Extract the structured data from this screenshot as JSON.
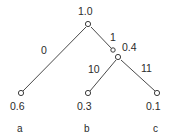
{
  "diagram": {
    "type": "binary-code-tree",
    "title": "",
    "colors": {
      "background": "#ffffff",
      "edge": "#4a4a4a",
      "node_stroke": "#3c3c3c",
      "node_fill": "#ffffff",
      "text": "#2b2b2b"
    },
    "nodes": [
      {
        "id": "root",
        "probability": "1.0",
        "x": 88,
        "y": 24,
        "label_x": 78,
        "label_y": 7,
        "kind": "internal"
      },
      {
        "id": "edge-marker-1",
        "probability": "",
        "x": 113,
        "y": 50,
        "kind": "marker"
      },
      {
        "id": "internal-right",
        "probability": "0.4",
        "x": 118,
        "y": 57,
        "label_x": 122,
        "label_y": 42,
        "kind": "internal"
      },
      {
        "id": "leaf-a",
        "probability": "0.6",
        "symbol": "a",
        "x": 21,
        "y": 93,
        "kind": "leaf"
      },
      {
        "id": "leaf-b",
        "probability": "0.3",
        "symbol": "b",
        "x": 88,
        "y": 93,
        "kind": "leaf"
      },
      {
        "id": "leaf-c",
        "probability": "0.1",
        "symbol": "c",
        "x": 157,
        "y": 93,
        "kind": "leaf"
      }
    ],
    "edges": [
      {
        "id": "edge-root-a",
        "from": "root",
        "to": "leaf-a",
        "code": "0",
        "x1": 86,
        "y1": 27,
        "x2": 23,
        "y2": 91,
        "label_x": 41,
        "label_y": 45
      },
      {
        "id": "edge-root-internal",
        "from": "root",
        "to": "internal-right",
        "code": "1",
        "x1": 91,
        "y1": 27,
        "x2": 112,
        "y2": 49,
        "label_x": 110,
        "label_y": 32
      },
      {
        "id": "edge-internal-b",
        "from": "internal-right",
        "to": "leaf-b",
        "code": "10",
        "x1": 116,
        "y1": 60,
        "x2": 90,
        "y2": 91,
        "label_x": 88,
        "label_y": 64
      },
      {
        "id": "edge-internal-c",
        "from": "internal-right",
        "to": "leaf-c",
        "code": "11",
        "x1": 121,
        "y1": 60,
        "x2": 155,
        "y2": 91,
        "label_x": 141,
        "label_y": 63
      }
    ],
    "leaf_probability_labels": [
      {
        "id": "prob-a",
        "text": "0.6",
        "x": 10,
        "y": 101
      },
      {
        "id": "prob-b",
        "text": "0.3",
        "x": 77,
        "y": 101
      },
      {
        "id": "prob-c",
        "text": "0.1",
        "x": 146,
        "y": 101
      }
    ],
    "leaf_symbol_labels": [
      {
        "id": "symbol-a",
        "text": "a",
        "x": 17,
        "y": 123
      },
      {
        "id": "symbol-b",
        "text": "b",
        "x": 84,
        "y": 123
      },
      {
        "id": "symbol-c",
        "text": "c",
        "x": 153,
        "y": 123
      }
    ]
  }
}
